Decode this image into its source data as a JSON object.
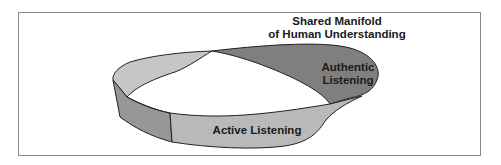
{
  "figure": {
    "title_line1": "Shared Manifold",
    "title_line2": "of Human Understanding",
    "regions": [
      {
        "id": "authentic",
        "label_line1": "Authentic",
        "label_line2": "Listening",
        "fill": "#7f7f7f"
      },
      {
        "id": "active",
        "label": "Active Listening",
        "fill": "#b9b9b9"
      },
      {
        "id": "left-back-band",
        "fill": "#c6c6c6"
      },
      {
        "id": "left-side-band",
        "fill": "#979797"
      }
    ],
    "colors": {
      "border": "#8a8a8a",
      "stroke": "#222222",
      "background": "#ffffff"
    }
  }
}
